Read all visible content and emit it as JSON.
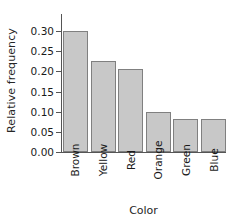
{
  "chart_data": {
    "type": "bar",
    "title": "",
    "subtitle": "",
    "xlabel": "Color",
    "ylabel": "Relative frequency",
    "categories": [
      "Brown",
      "Yellow",
      "Red",
      "Orange",
      "Green",
      "Blue"
    ],
    "values": [
      0.3,
      0.225,
      0.207,
      0.098,
      0.082,
      0.082
    ],
    "ylim": [
      0.0,
      0.3
    ],
    "ytick_labels": [
      "0.00",
      "0.05",
      "0.10",
      "0.15",
      "0.20",
      "0.25",
      "0.30"
    ],
    "ytick_values": [
      0.0,
      0.05,
      0.1,
      0.15,
      0.2,
      0.25,
      0.3
    ],
    "grid": false,
    "legend": "none",
    "bar_fill_color": "#c8c8c8",
    "bar_border_color": "#808080",
    "axis_color": "#555555",
    "text_color": "#1a1a1a",
    "background_color": "#ffffff"
  }
}
